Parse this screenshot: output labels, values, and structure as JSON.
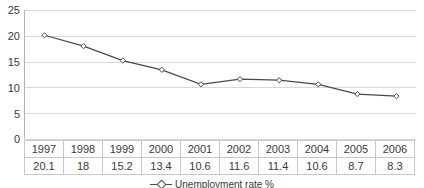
{
  "chart_data": {
    "type": "line",
    "title": "",
    "xlabel": "",
    "ylabel": "",
    "categories": [
      "1997",
      "1998",
      "1999",
      "2000",
      "2001",
      "2002",
      "2003",
      "2004",
      "2005",
      "2006"
    ],
    "values": [
      20.1,
      18,
      15.2,
      13.4,
      10.6,
      11.6,
      11.4,
      10.6,
      8.7,
      8.3
    ],
    "value_labels": [
      "20.1",
      "18",
      "15.2",
      "13.4",
      "10.6",
      "11.6",
      "11.4",
      "10.6",
      "8.7",
      "8.3"
    ],
    "series": [
      {
        "name": "Unemployment rate %",
        "values": [
          20.1,
          18,
          15.2,
          13.4,
          10.6,
          11.6,
          11.4,
          10.6,
          8.7,
          8.3
        ],
        "line_color": "#4a4a4a",
        "marker": "diamond-open"
      }
    ],
    "ylim": [
      0,
      25
    ],
    "yticks": [
      0,
      5,
      10,
      15,
      20,
      25
    ],
    "ytick_labels": [
      "0",
      "5",
      "10",
      "15",
      "20",
      "25"
    ],
    "grid": true,
    "legend_position": "bottom",
    "legend_entries": [
      "Unemployment rate %"
    ],
    "has_data_table": true
  },
  "colors": {
    "line": "#4a4a4a",
    "grid": "#d8d8d8",
    "axis": "#b4b4b4",
    "text": "#3a3a3a",
    "table_border": "#c8c8c8",
    "background": "#ffffff"
  },
  "legend": {
    "label": "Unemployment rate %"
  }
}
